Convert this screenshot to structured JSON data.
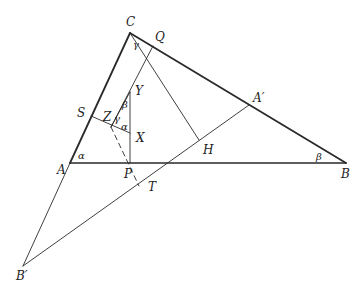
{
  "diagram": {
    "points": {
      "C": "C",
      "Q": "Q",
      "Y": "Y",
      "S": "S",
      "Z": "Z",
      "X": "X",
      "A_prime": "A′",
      "A": "A",
      "H": "H",
      "B": "B",
      "P": "P",
      "T": "T",
      "B_prime": "B′"
    },
    "angles": {
      "gamma_top": "γ",
      "beta_y": "β",
      "gamma_z": "γ",
      "alpha_x": "α",
      "alpha_a": "α",
      "beta_b": "β"
    },
    "colors": {
      "line": "#2a2a2a",
      "background": "#ffffff"
    }
  }
}
